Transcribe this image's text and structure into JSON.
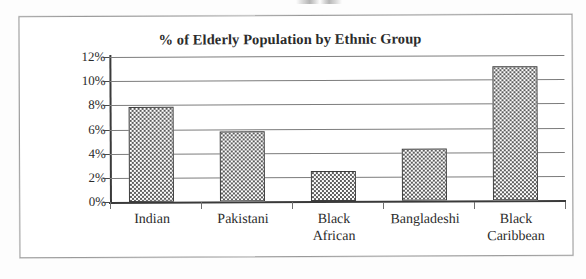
{
  "chart_data": {
    "type": "bar",
    "title": "% of Elderly Population by Ethnic Group",
    "xlabel": "",
    "ylabel": "",
    "categories": [
      "Indian",
      "Pakistani",
      "Black African",
      "Bangladeshi",
      "Black Caribbean"
    ],
    "values": [
      7.9,
      5.8,
      2.5,
      4.3,
      11.1
    ],
    "ylim": [
      0,
      12
    ],
    "ytick_labels": [
      "0%",
      "2%",
      "4%",
      "6%",
      "8%",
      "10%",
      "12%"
    ],
    "ytick_values": [
      0,
      2,
      4,
      6,
      8,
      10,
      12
    ],
    "grid": true,
    "legend": null,
    "bar_fill": "stippled-dot-pattern",
    "bar_outline_color": "#3d3d3d",
    "axis_color": "#3a3a3a",
    "gridline_color": "#7c7c7c"
  },
  "figure": {
    "frame_border_color": "#9a9a9a",
    "background_color": "#fdfdfd"
  },
  "categories_display": [
    "Indian",
    "Pakistani",
    "Black\nAfrican",
    "Bangladeshi",
    "Black\nCaribbean"
  ]
}
